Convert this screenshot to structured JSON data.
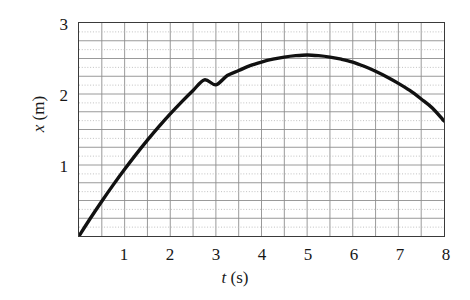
{
  "chart_data": {
    "type": "line",
    "title": "",
    "xlabel": "t (s)",
    "xlabel_var": "t",
    "xlabel_unit": "(s)",
    "ylabel": "x (m)",
    "ylabel_var": "x",
    "ylabel_unit": "(m)",
    "xlim": [
      0,
      8
    ],
    "ylim": [
      0,
      3
    ],
    "xticks": [
      1,
      2,
      3,
      4,
      5,
      6,
      7,
      8
    ],
    "xtick_labels": [
      "1",
      "2",
      "3",
      "4",
      "5",
      "6",
      "7",
      "8"
    ],
    "yticks": [
      1,
      2,
      3
    ],
    "ytick_labels": [
      "1",
      "2",
      "3"
    ],
    "grid": true,
    "grid_major_x_step": 0.5,
    "grid_major_y_step": 0.25,
    "grid_minor_y_step": 0.125,
    "legend": "none",
    "series": [
      {
        "name": "position",
        "color": "#111111",
        "linewidth": 3.4,
        "x": [
          0,
          0.25,
          0.5,
          0.75,
          1.0,
          1.25,
          1.5,
          1.75,
          2.0,
          2.25,
          2.5,
          2.75,
          3.0,
          3.25,
          3.5,
          3.75,
          4.0,
          4.25,
          4.5,
          4.75,
          5.0,
          5.25,
          5.5,
          5.75,
          6.0,
          6.25,
          6.5,
          6.75,
          7.0,
          7.25,
          7.5,
          7.75,
          8.0
        ],
        "y": [
          0.0,
          0.25,
          0.49,
          0.72,
          0.94,
          1.15,
          1.35,
          1.54,
          1.72,
          1.89,
          2.05,
          2.2,
          2.13,
          2.26,
          2.33,
          2.4,
          2.45,
          2.49,
          2.52,
          2.54,
          2.55,
          2.54,
          2.52,
          2.49,
          2.45,
          2.39,
          2.32,
          2.24,
          2.15,
          2.05,
          1.93,
          1.8,
          1.62
        ]
      }
    ],
    "annotations": {
      "peak_t": 5.0,
      "peak_x": 2.55,
      "start_t": 0,
      "start_x": 0,
      "end_t": 8,
      "end_x": 1.62
    },
    "colors": {
      "curve": "#111111",
      "frame": "#3a3a3a",
      "grid_major": "#8d8d8d",
      "grid_minor": "#b9b9b9",
      "text": "#171717",
      "background": "#ffffff"
    }
  }
}
